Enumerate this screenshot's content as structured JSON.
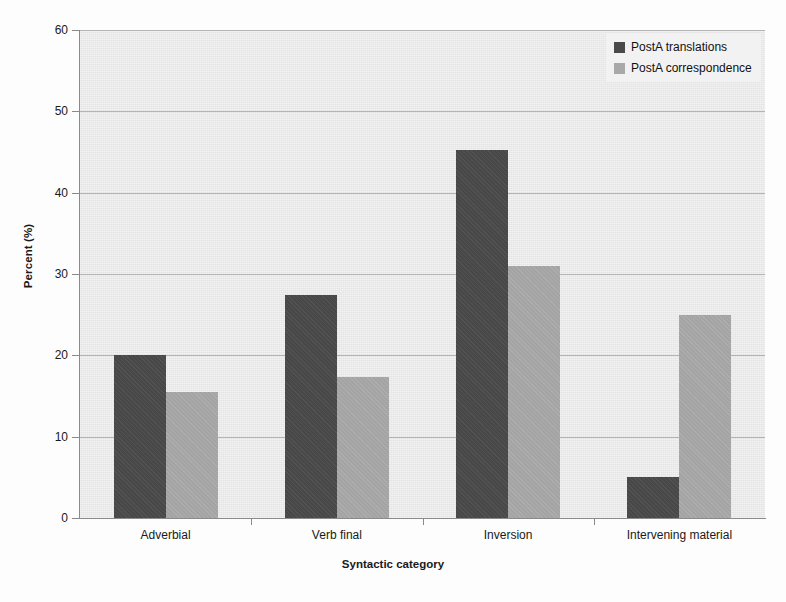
{
  "chart_data": {
    "type": "bar",
    "title": "",
    "xlabel": "Syntactic category",
    "ylabel": "Percent (%)",
    "categories": [
      "Adverbial",
      "Verb final",
      "Inversion",
      "Intervening material"
    ],
    "series": [
      {
        "name": "PostA translations",
        "color": "#4a4a4a",
        "values": [
          20.0,
          27.4,
          45.2,
          5.0
        ]
      },
      {
        "name": "PostA correspondence",
        "color": "#a9a9a9",
        "values": [
          15.5,
          17.4,
          31.0,
          25.0
        ]
      }
    ],
    "ylim": [
      0,
      60
    ],
    "yticks": [
      0,
      10,
      20,
      30,
      40,
      50,
      60
    ],
    "grid": true,
    "legend_position": "top-right",
    "plot_background": "#e8e8e8"
  },
  "axes": {
    "y_title": "Percent (%)",
    "x_title": "Syntactic category",
    "y_tick_labels": [
      "0",
      "10",
      "20",
      "30",
      "40",
      "50",
      "60"
    ],
    "x_tick_labels": [
      "Adverbial",
      "Verb final",
      "Inversion",
      "Intervening material"
    ]
  },
  "legend": {
    "items": [
      {
        "label": "PostA translations"
      },
      {
        "label": "PostA correspondence"
      }
    ]
  }
}
